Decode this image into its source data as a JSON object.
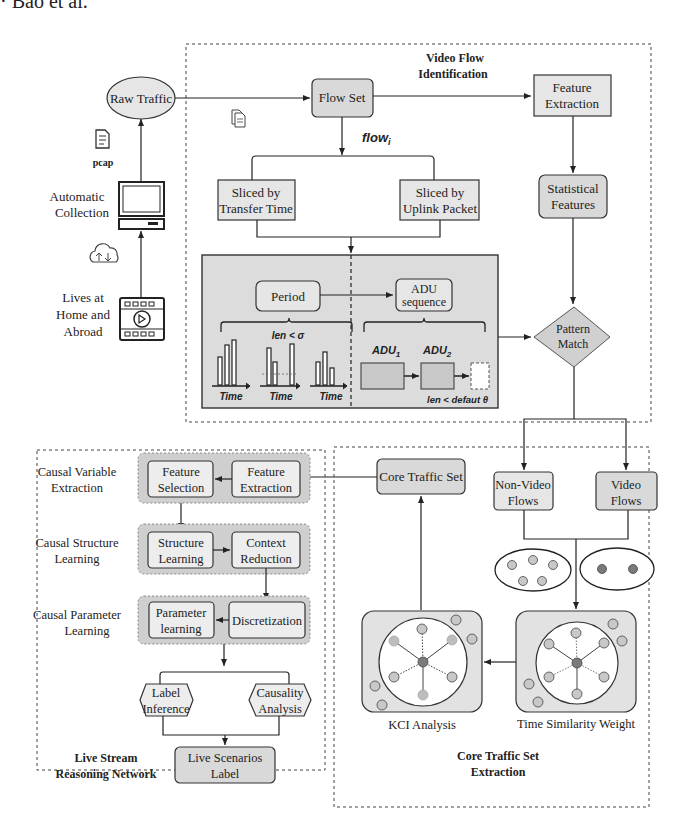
{
  "header_fragment": "· Bao et al.",
  "colors": {
    "box_fill": "#e6e6e6",
    "box_stroke": "#333333",
    "panel_fill": "#d9d9d9",
    "group_fill": "#cfcfcf",
    "node_light": "#c8c8c8",
    "node_dark": "#7a7a7a",
    "background": "#ffffff"
  },
  "source": {
    "raw_traffic": "Raw Traffic",
    "pcap_label": "pcap",
    "automatic_collection": [
      "Automatic",
      "Collection"
    ],
    "lives": [
      "Lives at",
      "Home and",
      "Abroad"
    ]
  },
  "video_flow": {
    "title": [
      "Video Flow",
      "Identification"
    ],
    "flow_set": "Flow Set",
    "flow_i": "flow",
    "flow_i_sub": "i",
    "sliced_time": [
      "Sliced by",
      "Transfer Time"
    ],
    "sliced_uplink": [
      "Sliced by",
      "Uplink Packet"
    ],
    "feature_extraction": [
      "Feature",
      "Extraction"
    ],
    "statistical_features": [
      "Statistical",
      "Features"
    ],
    "period": "Period",
    "adu_sequence": [
      "ADU",
      "sequence"
    ],
    "len_sigma": "len < σ",
    "time_labels": [
      "Time",
      "Time",
      "Time"
    ],
    "adu1": "ADU",
    "adu1_sub": "1",
    "adu2": "ADU",
    "adu2_sub": "2",
    "len_theta": "len < defaut θ",
    "pattern_match": [
      "Pattern",
      "Match"
    ]
  },
  "core_traffic": {
    "title": [
      "Core Traffic Set",
      "Extraction"
    ],
    "core_traffic_set": "Core Traffic Set",
    "non_video": [
      "Non-Video",
      "Flows"
    ],
    "video": [
      "Video",
      "Flows"
    ],
    "kci_analysis": "KCI Analysis",
    "time_similarity": "Time Similarity Weight"
  },
  "reasoning": {
    "title": [
      "Live Stream",
      "Reasoning Network"
    ],
    "stage1_label": [
      "Causal Variable",
      "Extraction"
    ],
    "stage2_label": [
      "Causal Structure",
      "Learning"
    ],
    "stage3_label": [
      "Causal Parameter",
      "Learning"
    ],
    "feature_selection": [
      "Feature",
      "Selection"
    ],
    "feature_extraction": [
      "Feature",
      "Extraction"
    ],
    "structure_learning": [
      "Structure",
      "Learning"
    ],
    "context_reduction": [
      "Context",
      "Reduction"
    ],
    "parameter_learning": [
      "Parameter",
      "learning"
    ],
    "discretization": "Discretization",
    "label_inference": [
      "Label",
      "Inference"
    ],
    "causality_analysis": [
      "Causality",
      "Analysis"
    ],
    "live_scenarios": [
      "Live Scenarios",
      "Label"
    ]
  }
}
